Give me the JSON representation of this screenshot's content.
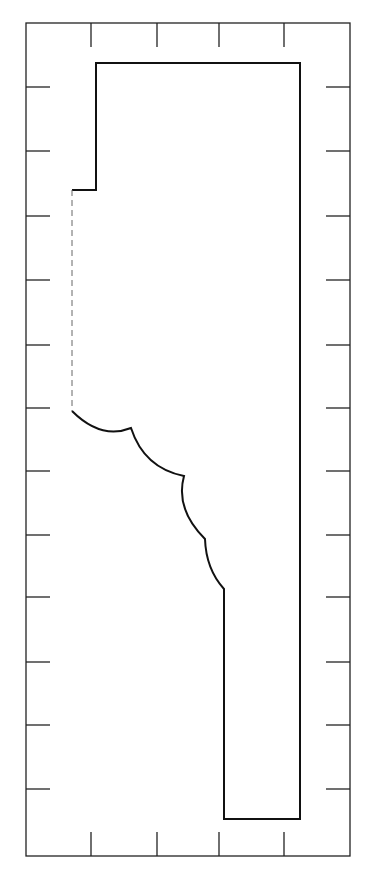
{
  "diagram": {
    "type": "molding-profile",
    "colors": {
      "background": "#ffffff",
      "line": "#111111",
      "frame": "#222222"
    },
    "frame": {
      "x": 26,
      "y": 23,
      "width": 324,
      "height": 833
    },
    "ticks": {
      "top": [
        91,
        157,
        219,
        284
      ],
      "bottom": [
        91,
        157,
        219,
        284
      ],
      "left": [
        87,
        151,
        216,
        280,
        345,
        408,
        471,
        535,
        597,
        662,
        725,
        789
      ],
      "right": [
        87,
        151,
        216,
        280,
        345,
        408,
        471,
        535,
        597,
        662,
        725,
        789
      ],
      "length": 24
    },
    "profile": {
      "top_y": 63,
      "right_x": 300,
      "bottom_y": 819,
      "step": {
        "x_outer": 96,
        "x_inner": 72,
        "y": 190
      },
      "dashed_edge": {
        "x": 72,
        "y1": 190,
        "y2": 411
      },
      "cusps": [
        [
          72,
          411
        ],
        [
          131,
          428
        ],
        [
          184,
          476
        ],
        [
          205,
          539
        ],
        [
          224,
          589
        ]
      ],
      "bottom_left_x": 224
    }
  }
}
